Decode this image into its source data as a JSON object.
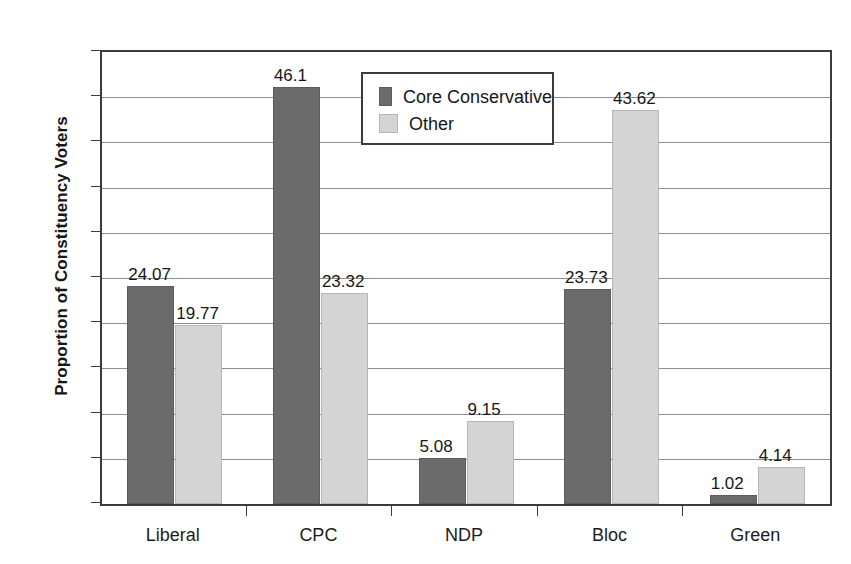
{
  "chart_data": {
    "type": "bar",
    "title": "",
    "subtitle": "",
    "xlabel": "",
    "ylabel": "Proportion of Constituency Voters",
    "categories": [
      "Liberal",
      "CPC",
      "NDP",
      "Bloc",
      "Green"
    ],
    "series": [
      {
        "name": "Core Conservative",
        "color": "#6b6b6b",
        "values": [
          24.07,
          46.1,
          5.08,
          23.73,
          1.02
        ],
        "labels": [
          "24.07",
          "46.1",
          "5.08",
          "23.73",
          "1.02"
        ]
      },
      {
        "name": "Other",
        "color": "#d4d4d4",
        "values": [
          19.77,
          23.32,
          9.15,
          43.62,
          4.14
        ],
        "labels": [
          "19.77",
          "23.32",
          "9.15",
          "43.62",
          "4.14"
        ]
      }
    ],
    "ylim": [
      0,
      50
    ],
    "ytick_step": 5,
    "ytick_labels": [
      "0",
      "5",
      "10",
      "15",
      "20",
      "25",
      "30",
      "35",
      "40",
      "45",
      "50"
    ],
    "grid": true,
    "grid_axis": "y",
    "legend_position": "inside-top-center",
    "legend_entries": [
      "Core Conservative",
      "Other"
    ],
    "bar_value_labels": true
  }
}
